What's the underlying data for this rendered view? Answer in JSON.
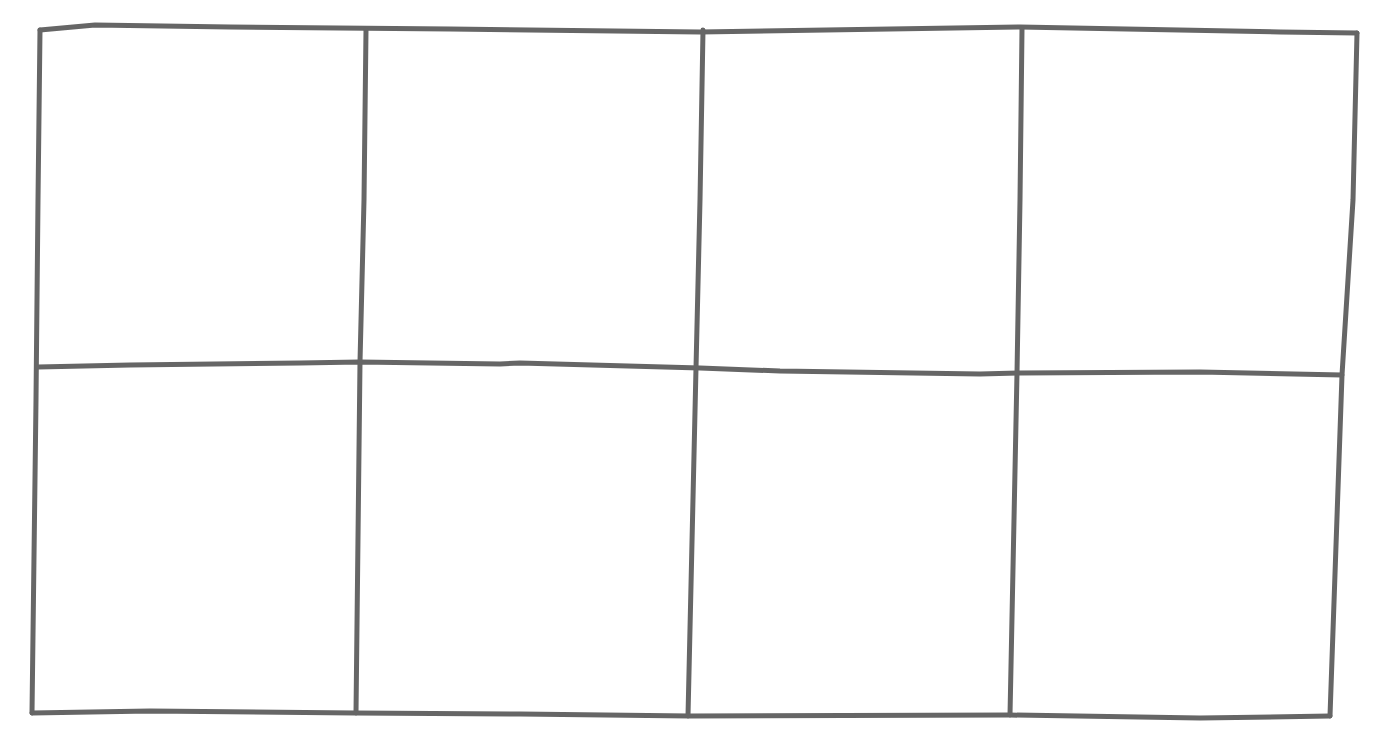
{
  "diagram": {
    "type": "hand-drawn-panel-grid",
    "rows": 2,
    "columns": 4,
    "stroke_color": "#666666",
    "background_color": "#ffffff",
    "stroke_width": 5,
    "outer": {
      "top": [
        [
          40,
          30
        ],
        [
          95,
          25
        ],
        [
          230,
          27
        ],
        [
          450,
          29
        ],
        [
          700,
          32
        ],
        [
          1020,
          27
        ],
        [
          1280,
          32
        ],
        [
          1357,
          33
        ]
      ],
      "bottom": [
        [
          32,
          713
        ],
        [
          150,
          711
        ],
        [
          355,
          713
        ],
        [
          520,
          714
        ],
        [
          690,
          716
        ],
        [
          1010,
          715
        ],
        [
          1200,
          718
        ],
        [
          1330,
          716
        ]
      ],
      "left": [
        [
          40,
          30
        ],
        [
          38,
          200
        ],
        [
          36,
          400
        ],
        [
          32,
          713
        ]
      ],
      "right": [
        [
          1357,
          33
        ],
        [
          1353,
          200
        ],
        [
          1342,
          375
        ],
        [
          1330,
          716
        ]
      ]
    },
    "middle_line": [
      [
        38,
        367
      ],
      [
        130,
        365
      ],
      [
        300,
        363
      ],
      [
        360,
        362
      ],
      [
        500,
        364
      ],
      [
        520,
        363
      ],
      [
        700,
        368
      ],
      [
        780,
        371
      ],
      [
        980,
        374
      ],
      [
        1020,
        373
      ],
      [
        1200,
        372
      ],
      [
        1342,
        375
      ]
    ],
    "column_lines": [
      [
        [
          366,
          30
        ],
        [
          364,
          200
        ],
        [
          360,
          362
        ],
        [
          356,
          713
        ]
      ],
      [
        [
          703,
          30
        ],
        [
          700,
          200
        ],
        [
          696,
          368
        ],
        [
          688,
          716
        ]
      ],
      [
        [
          1022,
          29
        ],
        [
          1020,
          200
        ],
        [
          1017,
          373
        ],
        [
          1010,
          715
        ]
      ]
    ],
    "panels": [
      {
        "row": 1,
        "col": 1,
        "content": ""
      },
      {
        "row": 1,
        "col": 2,
        "content": ""
      },
      {
        "row": 1,
        "col": 3,
        "content": ""
      },
      {
        "row": 1,
        "col": 4,
        "content": ""
      },
      {
        "row": 2,
        "col": 1,
        "content": ""
      },
      {
        "row": 2,
        "col": 2,
        "content": ""
      },
      {
        "row": 2,
        "col": 3,
        "content": ""
      },
      {
        "row": 2,
        "col": 4,
        "content": ""
      }
    ]
  }
}
